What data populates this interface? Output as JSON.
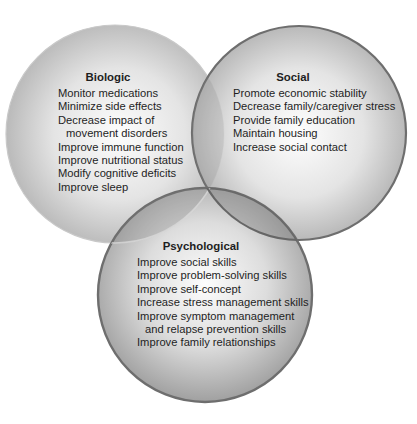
{
  "diagram": {
    "type": "venn",
    "colors": {
      "background": "#ffffff",
      "circle_fill_center": "#fbfbfb",
      "circle_fill_edge": "#a9a9a9",
      "biologic_border": "#c4c4c4",
      "social_border": "#6e6e6e",
      "psychological_border": "#6e6e6e",
      "text": "#1e1e1e"
    },
    "circles": [
      {
        "id": "biologic",
        "heading": "Biologic",
        "items": [
          "Monitor medications",
          "Minimize side effects",
          "Decrease impact of",
          "movement disorders",
          "Improve immune function",
          "Improve nutritional status",
          "Modify cognitive deficits",
          "Improve sleep"
        ]
      },
      {
        "id": "social",
        "heading": "Social",
        "items": [
          "Promote economic stability",
          "Decrease family/caregiver stress",
          "Provide family education",
          "Maintain housing",
          "Increase social contact"
        ]
      },
      {
        "id": "psychological",
        "heading": "Psychological",
        "items": [
          "Improve social skills",
          "Improve problem-solving skills",
          "Improve self-concept",
          "Increase stress management skills",
          "Improve symptom management",
          "and relapse prevention skills",
          "Improve family relationships"
        ]
      }
    ]
  }
}
